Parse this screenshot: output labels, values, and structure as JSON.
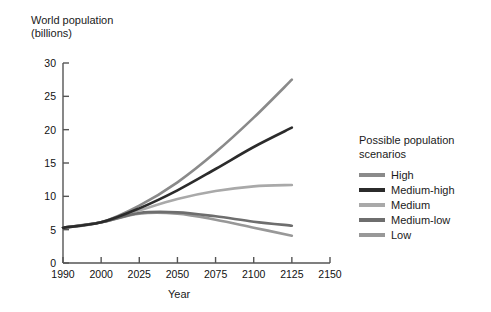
{
  "chart_data": {
    "type": "line",
    "title": "",
    "ylabel": "World population\n(billions)",
    "xlabel": "Year",
    "x": [
      1990,
      2000,
      2025,
      2050,
      2075,
      2100,
      2125
    ],
    "xtick_labels": [
      "1990",
      "2000",
      "2025",
      "2050",
      "2075",
      "2100",
      "2125",
      "2150"
    ],
    "ytick_labels": [
      "0",
      "5",
      "10",
      "15",
      "20",
      "25",
      "30"
    ],
    "xlim": [
      1990,
      2150
    ],
    "ylim": [
      0,
      30
    ],
    "grid": false,
    "legend_position": "right",
    "series": [
      {
        "name": "High",
        "color": "#8a8a8a",
        "values": [
          5.3,
          6.1,
          8.6,
          12.1,
          16.6,
          21.8,
          27.5
        ]
      },
      {
        "name": "Medium-high",
        "color": "#2b2b2b",
        "values": [
          5.3,
          6.1,
          8.2,
          10.9,
          14.1,
          17.4,
          20.3
        ]
      },
      {
        "name": "Medium",
        "color": "#a9a9a9",
        "values": [
          5.3,
          6.1,
          7.9,
          9.6,
          10.8,
          11.5,
          11.7
        ]
      },
      {
        "name": "Medium-low",
        "color": "#6e6e6e",
        "values": [
          5.3,
          6.1,
          7.5,
          7.6,
          7.0,
          6.2,
          5.6
        ]
      },
      {
        "name": "Low",
        "color": "#989898",
        "values": [
          5.3,
          6.1,
          7.4,
          7.4,
          6.5,
          5.3,
          4.1
        ]
      }
    ]
  },
  "axes": {
    "y_title": "World population\n(billions)",
    "x_title": "Year",
    "y_ticks": [
      {
        "label": "30",
        "value": 30
      },
      {
        "label": "25",
        "value": 25
      },
      {
        "label": "20",
        "value": 20
      },
      {
        "label": "15",
        "value": 15
      },
      {
        "label": "10",
        "value": 10
      },
      {
        "label": "5",
        "value": 5
      },
      {
        "label": "0",
        "value": 0
      }
    ],
    "x_ticks": [
      {
        "label": "1990",
        "value": 1990
      },
      {
        "label": "2000",
        "value": 2000
      },
      {
        "label": "2025",
        "value": 2025
      },
      {
        "label": "2050",
        "value": 2050
      },
      {
        "label": "2075",
        "value": 2075
      },
      {
        "label": "2100",
        "value": 2100
      },
      {
        "label": "2125",
        "value": 2125
      },
      {
        "label": "2150",
        "value": 2150
      }
    ]
  },
  "legend": {
    "title": "Possible population\nscenarios",
    "items": [
      {
        "label": "High",
        "color": "#8a8a8a"
      },
      {
        "label": "Medium-high",
        "color": "#2b2b2b"
      },
      {
        "label": "Medium",
        "color": "#a9a9a9"
      },
      {
        "label": "Medium-low",
        "color": "#6e6e6e"
      },
      {
        "label": "Low",
        "color": "#989898"
      }
    ]
  },
  "style": {
    "axis_color": "#555555",
    "background": "#ffffff",
    "text_color": "#1a1a1a"
  }
}
